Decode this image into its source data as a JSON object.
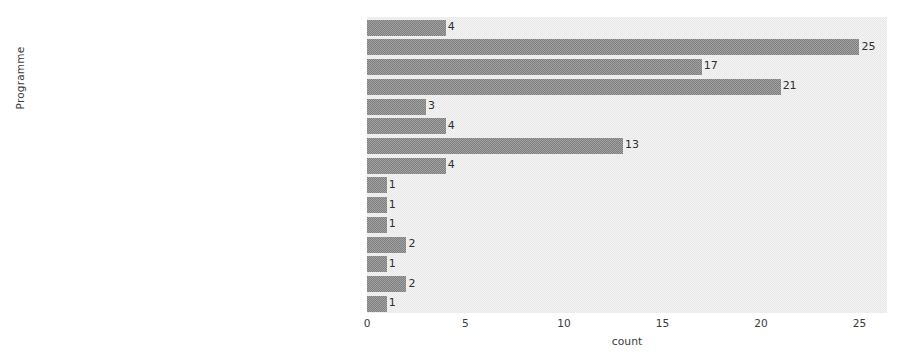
{
  "chart_data": {
    "type": "bar",
    "orientation": "horizontal",
    "title": "",
    "xlabel": "count",
    "ylabel": "Programme",
    "xlim": [
      0,
      26.4
    ],
    "xticks": [
      0,
      5,
      10,
      15,
      20,
      25
    ],
    "xtick_labels": [
      "0",
      "5",
      "10",
      "15",
      "20",
      "25"
    ],
    "grid": false,
    "legend": null,
    "bar_color": "#8a8a8a",
    "plot_background": "#eaeaea",
    "categories": [
      "e-commerce",
      "computer science and technology",
      "data science and big data technology",
      "software engineering",
      "information management and information system",
      "geographic information science",
      "information and computing science",
      "internet of things engineering",
      "electronic information science and technology",
      "network engineering",
      "smart science and technology",
      "smart medical engineering",
      "data computing and application",
      "artificial intelligence",
      "information countermeasure technology"
    ],
    "values": [
      4,
      25,
      17,
      21,
      3,
      4,
      13,
      4,
      1,
      1,
      1,
      2,
      1,
      2,
      1
    ],
    "value_labels": [
      "4",
      "25",
      "17",
      "21",
      "3",
      "4",
      "13",
      "4",
      "1",
      "1",
      "1",
      "2",
      "1",
      "2",
      "1"
    ]
  }
}
